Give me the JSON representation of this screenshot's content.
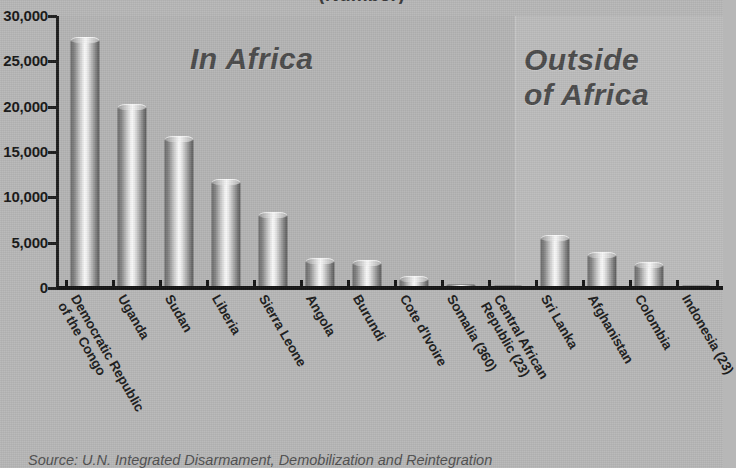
{
  "chart_data": {
    "type": "bar",
    "title": "(Number)",
    "xlabel": "",
    "ylabel": "",
    "ylim": [
      0,
      30000
    ],
    "ytick_labels": [
      "30,000",
      "25,000",
      "20,000",
      "15,000",
      "10,000",
      "5,000",
      "0"
    ],
    "ytick_values": [
      30000,
      25000,
      20000,
      15000,
      10000,
      5000,
      0
    ],
    "grid": false,
    "legend": "none",
    "categories": [
      "Democratic Republic\nof the Congo",
      "Uganda",
      "Sudan",
      "Liberia",
      "Sierra Leone",
      "Angola",
      "Burundi",
      "Cote d'Ivoire",
      "Somalia (360)",
      "Central African\nRepublic (23)",
      "Sri Lanka",
      "Afghanistan",
      "Colombia",
      "Indonesia (23)"
    ],
    "values": [
      27300,
      20000,
      16400,
      11700,
      8100,
      2950,
      2800,
      1000,
      360,
      23,
      5500,
      3600,
      2500,
      23
    ],
    "groups": [
      {
        "label": "In Africa",
        "from": 0,
        "to": 9
      },
      {
        "label": "Outside\nof Africa",
        "from": 9,
        "to": 13
      }
    ]
  },
  "panels": {
    "africa_label": "In Africa",
    "outside_label_line1": "Outside",
    "outside_label_line2": "of Africa"
  },
  "footer": {
    "source_prefix": "Source:",
    "source_text": "U.N. Integrated Disarmament, Demobilization and Reintegration"
  },
  "colors": {
    "background": "#b7b7b7",
    "panel_africa": "#b4b4b4",
    "panel_outside": "#bcbcbc",
    "axis": "#141414",
    "text": "#1b1b1b",
    "caption": "#4a4a4a"
  }
}
